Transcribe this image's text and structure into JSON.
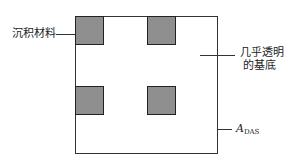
{
  "diagram": {
    "labels": {
      "deposited_material": "沉积材料",
      "substrate_line1": "几乎透明",
      "substrate_line2": "的基底",
      "area_symbol": "A",
      "area_subscript": "DAS"
    },
    "colors": {
      "square_fill": "#8f8f8f",
      "outline": "#333333",
      "background": "#ffffff"
    }
  }
}
